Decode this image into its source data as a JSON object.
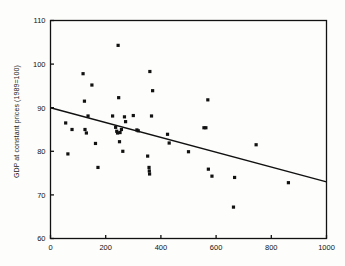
{
  "chart_data": {
    "type": "scatter",
    "title": "",
    "xlabel": "",
    "ylabel": "GDP at constant prices (1989=100)",
    "xlim": [
      0,
      1000
    ],
    "ylim": [
      60,
      110
    ],
    "xticks": [
      0,
      200,
      400,
      600,
      800,
      1000
    ],
    "yticks": [
      60,
      70,
      80,
      90,
      100,
      110
    ],
    "xtick_labels": [
      "0",
      "200",
      "400",
      "600",
      "800",
      "1000"
    ],
    "ytick_labels": [
      "60",
      "70",
      "80",
      "90",
      "100",
      "110"
    ],
    "grid": false,
    "legend": null,
    "marker": "square",
    "marker_color": "#111111",
    "line_color": "#111111",
    "points": [
      {
        "x": 55,
        "y": 86.5
      },
      {
        "x": 63,
        "y": 79.4
      },
      {
        "x": 78,
        "y": 85.0
      },
      {
        "x": 118,
        "y": 97.8
      },
      {
        "x": 123,
        "y": 91.5
      },
      {
        "x": 125,
        "y": 85.0
      },
      {
        "x": 130,
        "y": 84.2
      },
      {
        "x": 136,
        "y": 88.1
      },
      {
        "x": 150,
        "y": 95.2
      },
      {
        "x": 163,
        "y": 81.8
      },
      {
        "x": 172,
        "y": 76.3
      },
      {
        "x": 225,
        "y": 88.1
      },
      {
        "x": 236,
        "y": 85.5
      },
      {
        "x": 240,
        "y": 84.6
      },
      {
        "x": 243,
        "y": 84.2
      },
      {
        "x": 245,
        "y": 104.3
      },
      {
        "x": 247,
        "y": 92.3
      },
      {
        "x": 250,
        "y": 82.2
      },
      {
        "x": 252,
        "y": 84.3
      },
      {
        "x": 257,
        "y": 85.0
      },
      {
        "x": 262,
        "y": 80.0
      },
      {
        "x": 268,
        "y": 87.9
      },
      {
        "x": 272,
        "y": 86.8
      },
      {
        "x": 300,
        "y": 88.2
      },
      {
        "x": 313,
        "y": 84.9
      },
      {
        "x": 318,
        "y": 84.7
      },
      {
        "x": 352,
        "y": 78.9
      },
      {
        "x": 357,
        "y": 76.3
      },
      {
        "x": 358,
        "y": 75.5
      },
      {
        "x": 359,
        "y": 74.8
      },
      {
        "x": 360,
        "y": 98.3
      },
      {
        "x": 366,
        "y": 88.1
      },
      {
        "x": 370,
        "y": 93.9
      },
      {
        "x": 424,
        "y": 83.9
      },
      {
        "x": 430,
        "y": 81.9
      },
      {
        "x": 500,
        "y": 79.9
      },
      {
        "x": 556,
        "y": 85.4
      },
      {
        "x": 563,
        "y": 85.4
      },
      {
        "x": 570,
        "y": 91.8
      },
      {
        "x": 572,
        "y": 75.9
      },
      {
        "x": 585,
        "y": 74.3
      },
      {
        "x": 663,
        "y": 67.2
      },
      {
        "x": 667,
        "y": 74.0
      },
      {
        "x": 745,
        "y": 81.5
      },
      {
        "x": 862,
        "y": 72.8
      }
    ],
    "trend_line": {
      "x_start": 0,
      "y_start": 90.0,
      "x_end": 1000,
      "y_end": 73.0
    }
  }
}
